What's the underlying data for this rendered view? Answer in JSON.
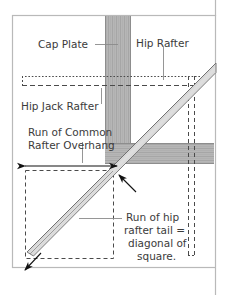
{
  "figure": {
    "title_alt": "Hip rafter tail framing plan",
    "background_color": "#ffffff",
    "frame_color": "#b9b9b9",
    "labels": {
      "cap_plate": "Cap Plate",
      "hip_rafter": "Hip Rafter",
      "hip_jack_rafter": "Hip Jack Rafter",
      "run_common_line1": "Run of Common",
      "run_common_line2": "Rafter Overhang",
      "run_hip_line1": "Run of hip",
      "run_hip_line2": "rafter tail =",
      "run_hip_line3": "diagonal of",
      "run_hip_line4": "square."
    },
    "colors": {
      "beam_fill": "#b4b4b4",
      "beam_grain": "#a0a0a0",
      "beam_edge": "#8d8d8d",
      "rafter_fill": "#dcdcdc",
      "rafter_edge": "#6f6f6f",
      "dash_line": "#4a4a4a",
      "leader_line": "#8a8a8a",
      "arrow": "#111111",
      "text": "#3b3b3b"
    },
    "geometry": {
      "cap_plate_x": [
        105,
        131
      ],
      "cap_plate_y": [
        16,
        164
      ],
      "ridge_beam_y": [
        143,
        164
      ],
      "ridge_beam_x": [
        105,
        214
      ],
      "dashed_square": [
        25,
        170,
        113,
        258
      ],
      "hip_rafter_start": [
        27,
        252
      ],
      "hip_rafter_end": [
        216,
        63
      ]
    }
  }
}
